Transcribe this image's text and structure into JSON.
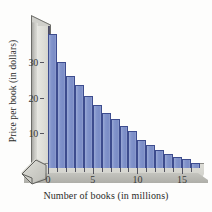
{
  "chart_data": {
    "type": "bar",
    "title": "",
    "xlabel": "Number of books (in millions)",
    "ylabel": "Price per book (in dollars)",
    "xlim": [
      0,
      17
    ],
    "ylim": [
      0,
      42
    ],
    "grid": false,
    "legend": null,
    "xticks": [
      0,
      5,
      10,
      15
    ],
    "xtick_labels": [
      "0",
      "5",
      "10",
      "15"
    ],
    "xminor_ticks": [
      1,
      2,
      3,
      4,
      6,
      7,
      8,
      9,
      11,
      12,
      13,
      14,
      16
    ],
    "yticks": [
      10,
      20,
      30
    ],
    "ytick_labels": [
      "10",
      "20",
      "30"
    ],
    "bar_width": 1,
    "categories": [
      0,
      1,
      2,
      3,
      4,
      5,
      6,
      7,
      8,
      9,
      10,
      11,
      12,
      13,
      14,
      15,
      16
    ],
    "values": [
      38,
      30,
      26,
      23.5,
      20.5,
      18,
      15.5,
      14,
      12,
      10.5,
      8,
      6.5,
      5,
      4,
      3,
      2.5,
      1.5
    ],
    "series": [
      {
        "name": "Price per book",
        "values": [
          38,
          30,
          26,
          23.5,
          20.5,
          18,
          15.5,
          14,
          12,
          10.5,
          8,
          6.5,
          5,
          4,
          3,
          2.5,
          1.5
        ]
      }
    ],
    "colors": {
      "bar_fill": "#8294cb",
      "bar_edge": "#3d4c8e",
      "wall": "#dcdcd6",
      "floor": "#cdcdc7",
      "text": "#2b2b29"
    }
  }
}
